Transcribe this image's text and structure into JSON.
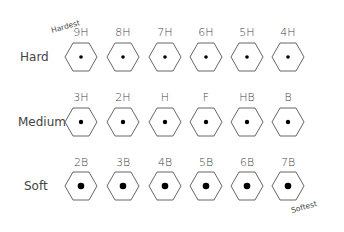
{
  "annotations": {
    "hardest": "Hardest",
    "softest": "Softest"
  },
  "rows": [
    {
      "label": "Hard",
      "dot_radius": 1.8,
      "grades": [
        "9H",
        "8H",
        "7H",
        "6H",
        "5H",
        "4H"
      ]
    },
    {
      "label": "Medium",
      "dot_radius": 2.2,
      "grades": [
        "3H",
        "2H",
        "H",
        "F",
        "HB",
        "B"
      ]
    },
    {
      "label": "Soft",
      "dot_radius": 3.3,
      "grades": [
        "2B",
        "3B",
        "4B",
        "5B",
        "6B",
        "7B"
      ]
    }
  ],
  "colors": {
    "stroke": "#555555",
    "dot": "#000000",
    "text": "#444444",
    "background": "#ffffff"
  }
}
